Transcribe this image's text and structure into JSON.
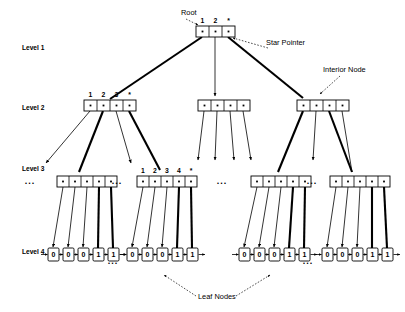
{
  "diagram": {
    "levels": [
      {
        "id": "level-1",
        "label": "Level 1",
        "x": 22,
        "y": 50
      },
      {
        "id": "level-2",
        "label": "Level 2",
        "x": 22,
        "y": 110
      },
      {
        "id": "level-3",
        "label": "Level 3",
        "x": 22,
        "y": 171
      },
      {
        "id": "level-4",
        "label": "Level 4",
        "x": 22,
        "y": 254
      }
    ],
    "annotations": [
      {
        "id": "root-label",
        "text": "Root",
        "x": 181,
        "y": 15
      },
      {
        "id": "star-pointer-label",
        "text": "Star Pointer",
        "x": 266,
        "y": 45
      },
      {
        "id": "interior-node-label",
        "text": "Interior Node",
        "x": 323,
        "y": 72
      },
      {
        "id": "leaf-nodes-label",
        "text": "Leaf Nodes",
        "x": 198,
        "y": 299
      }
    ],
    "cell_glyph": "•",
    "star_glyph": "*",
    "nodes": {
      "root": {
        "id": "root-node",
        "x": 196,
        "y": 26,
        "cells": 3,
        "cell_w": 13,
        "cell_h": 11,
        "keys": [
          "1",
          "2",
          "*"
        ]
      },
      "level2": [
        {
          "id": "interior-node-l2-a",
          "x": 84,
          "y": 100,
          "cells": 4,
          "cell_w": 13,
          "cell_h": 11,
          "keys": [
            "1",
            "2",
            "3",
            "*"
          ]
        },
        {
          "id": "interior-node-l2-b",
          "x": 198,
          "y": 100,
          "cells": 4,
          "cell_w": 13,
          "cell_h": 11,
          "keys": []
        },
        {
          "id": "interior-node-l2-c",
          "x": 297,
          "y": 100,
          "cells": 4,
          "cell_w": 13,
          "cell_h": 11,
          "keys": []
        }
      ],
      "level3": [
        {
          "id": "interior-node-l3-a",
          "x": 57,
          "y": 176,
          "cells": 5,
          "cell_w": 12,
          "cell_h": 11,
          "keys": []
        },
        {
          "id": "interior-node-l3-b",
          "x": 137,
          "y": 176,
          "cells": 5,
          "cell_w": 12,
          "cell_h": 11,
          "keys": [
            "1",
            "2",
            "3",
            "4",
            "*"
          ]
        },
        {
          "id": "interior-node-l3-c",
          "x": 251,
          "y": 176,
          "cells": 5,
          "cell_w": 12,
          "cell_h": 11,
          "keys": []
        },
        {
          "id": "interior-node-l3-d",
          "x": 330,
          "y": 176,
          "cells": 5,
          "cell_w": 12,
          "cell_h": 11,
          "keys": []
        }
      ],
      "level4": [
        {
          "id": "leaf-group-a",
          "x": 48,
          "y": 254,
          "values": [
            "0",
            "0",
            "0",
            "1",
            "1"
          ]
        },
        {
          "id": "leaf-group-b",
          "x": 127,
          "y": 254,
          "values": [
            "0",
            "0",
            "0",
            "1",
            "1"
          ]
        },
        {
          "id": "leaf-group-c",
          "x": 239,
          "y": 254,
          "values": [
            "0",
            "0",
            "0",
            "1",
            "1"
          ]
        },
        {
          "id": "leaf-group-d",
          "x": 322,
          "y": 254,
          "values": [
            "0",
            "0",
            "0",
            "1",
            "1"
          ]
        }
      ]
    },
    "ellipses": [
      {
        "id": "ellipsis-level3-left",
        "text": "...",
        "x": 30,
        "y": 184
      },
      {
        "id": "ellipsis-level3-mid-left",
        "text": "...",
        "x": 117,
        "y": 184
      },
      {
        "id": "ellipsis-level3-center",
        "text": "...",
        "x": 222,
        "y": 184
      },
      {
        "id": "ellipsis-level3-mid-right",
        "text": "...",
        "x": 312,
        "y": 184
      },
      {
        "id": "ellipsis-level4-left",
        "text": "...",
        "x": 113,
        "y": 264
      },
      {
        "id": "ellipsis-level4-right",
        "text": "...",
        "x": 308,
        "y": 264
      }
    ],
    "colors": {
      "stroke": "#000000",
      "fill": "#ffffff",
      "background": "#ffffff"
    }
  }
}
